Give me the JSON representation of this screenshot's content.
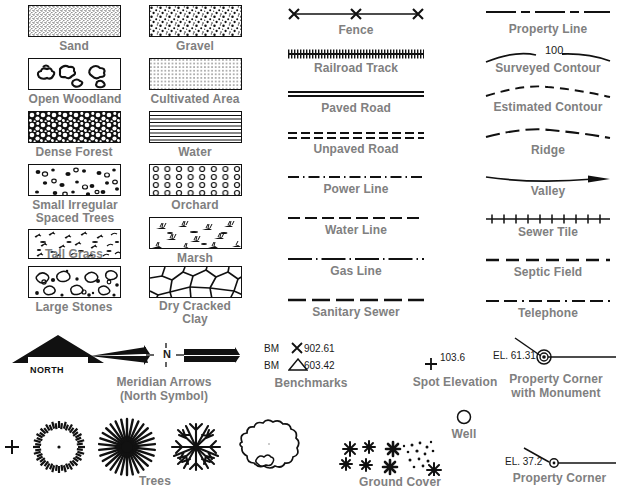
{
  "colors": {
    "label_gray": "#808080",
    "ink_black": "#111111",
    "annotation_black": "#1a1a1a",
    "background": "#ffffff"
  },
  "area_symbols": {
    "section_name": "area-texture-swatches",
    "column_left": [
      {
        "label": "Sand",
        "pattern": "fine-stipple"
      },
      {
        "label": "Open Woodland",
        "pattern": "sparse-blobs"
      },
      {
        "label": "Dense Forest",
        "pattern": "dense-blobs"
      },
      {
        "label": "Small Irregular\nSpaced Trees",
        "pattern": "scattered-dots"
      },
      {
        "label": "Tall Grass",
        "pattern": "grass-tufts"
      },
      {
        "label": "Large Stones",
        "pattern": "stones"
      }
    ],
    "column_right": [
      {
        "label": "Gravel",
        "pattern": "coarse-stipple"
      },
      {
        "label": "Cultivated Area",
        "pattern": "dot-grid"
      },
      {
        "label": "Water",
        "pattern": "horizontal-lines"
      },
      {
        "label": "Orchard",
        "pattern": "circle-grid"
      },
      {
        "label": "Marsh",
        "pattern": "marsh-tufts"
      },
      {
        "label": "Dry Cracked\nClay",
        "pattern": "crack-polygons"
      }
    ]
  },
  "line_symbols": {
    "section_name": "linear-feature-symbols",
    "column_middle": [
      {
        "label": "Fence",
        "style": "solid-with-x-marks"
      },
      {
        "label": "Railroad Track",
        "style": "crosstie-hatched"
      },
      {
        "label": "Paved Road",
        "style": "double-solid"
      },
      {
        "label": "Unpaved Road",
        "style": "double-dashed"
      },
      {
        "label": "Power Line",
        "style": "dash-dot"
      },
      {
        "label": "Water Line",
        "style": "long-dash"
      },
      {
        "label": "Gas Line",
        "style": "long-dash-dot"
      },
      {
        "label": "Sanitary Sewer",
        "style": "heavy-dash"
      }
    ],
    "column_right": [
      {
        "label": "Property Line",
        "style": "long-dash-short-dash"
      },
      {
        "label": "Surveyed Contour",
        "style": "contour-curve",
        "annotation": "100"
      },
      {
        "label": "Estimated Contour",
        "style": "dashed-curve"
      },
      {
        "label": "Ridge",
        "style": "long-dash-curve"
      },
      {
        "label": "Valley",
        "style": "solid-curve-arrow"
      },
      {
        "label": "Sewer Tile",
        "style": "tick-hatched"
      },
      {
        "label": "Septic Field",
        "style": "dash-spaced"
      },
      {
        "label": "Telephone",
        "style": "dash-dash-dot"
      }
    ]
  },
  "bottom_symbols": {
    "section_name": "point-and-misc-symbols",
    "north_arrow": {
      "label": "NORTH",
      "name": "solid-north-arrow"
    },
    "meridian": {
      "label": "Meridian Arrows\n(North Symbol)",
      "center_letter": "N"
    },
    "benchmarks": {
      "label": "Benchmarks",
      "entries": [
        {
          "prefix": "BM",
          "symbol": "x-mark",
          "elevation": "902.61"
        },
        {
          "prefix": "BM",
          "symbol": "triangle",
          "elevation": "603.42"
        }
      ]
    },
    "spot_elevation": {
      "label": "Spot Elevation",
      "symbol": "plus-mark",
      "elevation": "103.6"
    },
    "property_corner_monument": {
      "label": "Property Corner\nwith Monument",
      "elevation_text": "EL. 61.31"
    },
    "trees": {
      "label": "Trees",
      "variants": [
        "ticked-circle",
        "radial-burst",
        "branching-crown",
        "outline-blob"
      ],
      "center_mark": "plus-mark"
    },
    "ground_cover": {
      "label": "Ground Cover",
      "variants": [
        "star-cluster",
        "star-and-dots"
      ]
    },
    "well": {
      "label": "Well",
      "symbol": "open-circle"
    },
    "property_corner": {
      "label": "Property Corner",
      "elevation_text": "EL. 37.2",
      "symbol": "small-circle-with-dot"
    }
  }
}
